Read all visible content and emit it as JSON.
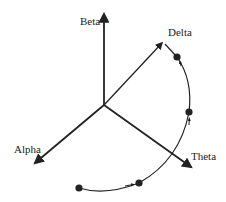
{
  "diagram": {
    "type": "3d-axes-trajectory",
    "axes": [
      {
        "id": "beta",
        "label": "Beta"
      },
      {
        "id": "delta",
        "label": "Delta"
      },
      {
        "id": "alpha",
        "label": "Alpha"
      },
      {
        "id": "theta",
        "label": "Theta"
      }
    ],
    "trajectory": {
      "points": 4,
      "direction": "from bottom-left toward Delta axis tip"
    },
    "colors": {
      "ink": "#222222",
      "background": "#ffffff"
    }
  }
}
